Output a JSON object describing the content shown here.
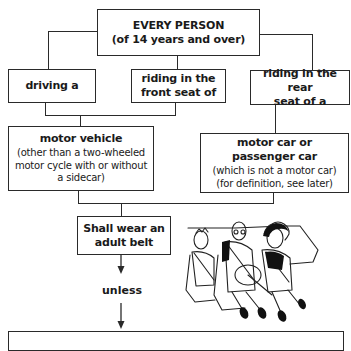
{
  "diagram": {
    "top": {
      "title": "EVERY PERSON",
      "subtitle": "(of 14 years and over)"
    },
    "roles": [
      {
        "label": "driving a"
      },
      {
        "label": "riding in the front seat of",
        "line1": "riding in the",
        "line2": "front seat of"
      },
      {
        "label": "riding in the rear seat of a",
        "line1": "riding in the rear",
        "line2": "seat of a"
      }
    ],
    "vehicles": [
      {
        "title": "motor vehicle",
        "line1": "(other than a two-wheeled",
        "line2": "motor cycle with or without",
        "line3": "a sidecar)"
      },
      {
        "title1": "motor car or",
        "title2": "passenger car",
        "line1": "(which is not a motor car)",
        "line2": "(for definition, see later)"
      }
    ],
    "obligation": {
      "line1": "Shall wear an",
      "line2": "adult belt"
    },
    "connector_label": "unless",
    "illustration": {
      "icon": "people-in-car-wearing-seatbelts-illustration"
    }
  }
}
